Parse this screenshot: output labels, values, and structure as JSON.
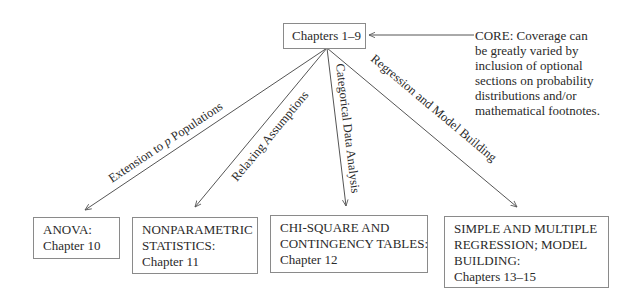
{
  "diagram": {
    "root": {
      "label": "Chapters 1–9"
    },
    "note": {
      "lines": [
        "CORE:   Coverage can",
        "be greatly varied by",
        "inclusion of optional",
        "sections on probability",
        "distributions and/or",
        "mathematical footnotes."
      ]
    },
    "branches": [
      {
        "edge_label_pre": "Extension to ",
        "edge_label_italic": "p",
        "edge_label_post": " Populations",
        "target_lines": [
          "ANOVA:",
          "Chapter 10"
        ]
      },
      {
        "edge_label": "Relaxing Assumptions",
        "target_lines": [
          "NONPARAMETRIC",
          "STATISTICS:",
          "Chapter 11"
        ]
      },
      {
        "edge_label": "Categorical Data Analysis",
        "target_lines": [
          "CHI-SQUARE AND",
          "CONTINGENCY TABLES:",
          "Chapter 12"
        ]
      },
      {
        "edge_label": "Regression and Model Building",
        "target_lines": [
          "SIMPLE AND MULTIPLE",
          "REGRESSION; MODEL",
          "BUILDING:",
          "Chapters 13–15"
        ]
      }
    ]
  },
  "colors": {
    "line": "#555555",
    "border": "#8a8a8a",
    "text": "#2a2a2a",
    "background": "#ffffff"
  }
}
